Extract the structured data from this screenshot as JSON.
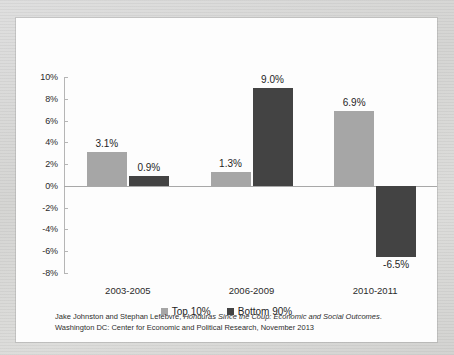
{
  "chart_data": {
    "type": "bar",
    "title": "",
    "subtitle": "",
    "xlabel": "",
    "ylabel": "",
    "categories": [
      "2003-2005",
      "2006-2009",
      "2010-2011"
    ],
    "series": [
      {
        "name": "Top 10%",
        "color": "#a6a6a6",
        "values": [
          3.1,
          1.3,
          6.9
        ],
        "labels": [
          "3.1%",
          "1.3%",
          "6.9%"
        ]
      },
      {
        "name": "Bottom 90%",
        "color": "#434343",
        "values": [
          0.9,
          9.0,
          -6.5
        ],
        "labels": [
          "0.9%",
          "9.0%",
          "-6.5%"
        ]
      }
    ],
    "ylim": [
      -8,
      10
    ],
    "ytick_values": [
      10,
      8,
      6,
      4,
      2,
      0,
      -2,
      -4,
      -6,
      -8
    ],
    "ytick_labels": [
      "10%",
      "8%",
      "6%",
      "4%",
      "2%",
      "0%",
      "-2%",
      "-4%",
      "-6%",
      "-8%"
    ],
    "grid": false,
    "legend_position": "bottom",
    "zero_line": true
  },
  "legend": {
    "items": [
      {
        "label": "Top 10%",
        "marker": "square-light-gray"
      },
      {
        "label": "Bottom 90%",
        "marker": "square-dark-gray"
      }
    ]
  },
  "caption": {
    "line1_pre": "Jake Johnston and Stephan Lefebvre, ",
    "line1_italic": "Honduras Since the Coup: Economic and Social Outcomes",
    "line1_post": ".",
    "line2": "Washington DC: Center for Economic and Political Research, November 2013"
  },
  "colors": {
    "series_light": "#a6a6a6",
    "series_dark": "#434343",
    "axis": "#b5b5b5",
    "zero_line": "#a8a8a8",
    "panel_background": "#fdfdfd",
    "page_background": "#d9d9d7"
  }
}
